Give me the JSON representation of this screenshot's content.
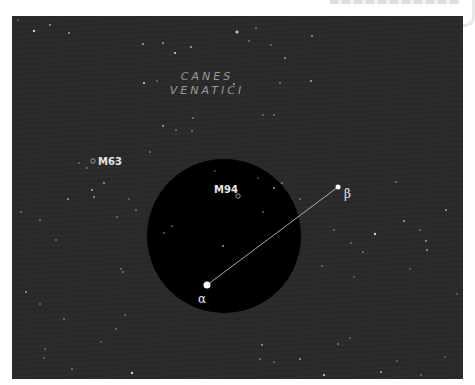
{
  "chart_data": {
    "type": "star-chart",
    "constellation": {
      "name_line1": "CANES",
      "name_line2": "VENATICI"
    },
    "field_of_view_circle": {
      "cx": 212,
      "cy": 220,
      "r": 77,
      "fill": "#000000"
    },
    "labeled_stars": [
      {
        "id": "alpha",
        "label": "α",
        "x": 195,
        "y": 269,
        "r": 3.5
      },
      {
        "id": "beta",
        "label": "β",
        "x": 326,
        "y": 171,
        "r": 2.5
      }
    ],
    "pointer_line": {
      "from": "alpha",
      "to": "beta",
      "color": "#cfcfcf"
    },
    "deep_sky_objects": [
      {
        "id": "M94",
        "label": "M94",
        "x": 226,
        "y": 180
      },
      {
        "id": "M63",
        "label": "M63",
        "x": 81,
        "y": 145
      }
    ],
    "background_stars": [
      [
        22,
        15,
        1.2
      ],
      [
        38,
        9,
        0.9
      ],
      [
        6,
        4,
        0.7
      ],
      [
        57,
        17,
        0.9
      ],
      [
        131,
        28,
        1.0
      ],
      [
        151,
        27,
        0.9
      ],
      [
        179,
        31,
        1.0
      ],
      [
        132,
        67,
        1.1
      ],
      [
        145,
        65,
        0.8
      ],
      [
        181,
        102,
        0.8
      ],
      [
        164,
        114,
        0.8
      ],
      [
        151,
        110,
        1.0
      ],
      [
        244,
        12,
        0.8
      ],
      [
        225,
        16,
        1.5
      ],
      [
        237,
        25,
        0.8
      ],
      [
        259,
        29,
        0.8
      ],
      [
        273,
        42,
        0.9
      ],
      [
        300,
        20,
        0.9
      ],
      [
        299,
        65,
        1.0
      ],
      [
        268,
        67,
        0.8
      ],
      [
        251,
        99,
        0.8
      ],
      [
        262,
        99,
        0.8
      ],
      [
        222,
        68,
        1.0
      ],
      [
        163,
        37,
        1.1
      ],
      [
        180,
        115,
        0.8
      ],
      [
        9,
        196,
        0.8
      ],
      [
        67,
        147,
        0.7
      ],
      [
        104,
        145,
        0.8
      ],
      [
        138,
        136,
        0.8
      ],
      [
        56,
        183,
        0.9
      ],
      [
        80,
        174,
        1.0
      ],
      [
        92,
        167,
        0.9
      ],
      [
        82,
        181,
        0.9
      ],
      [
        75,
        152,
        0.8
      ],
      [
        117,
        183,
        0.7
      ],
      [
        124,
        194,
        0.8
      ],
      [
        105,
        201,
        0.8
      ],
      [
        44,
        224,
        0.8
      ],
      [
        28,
        204,
        0.8
      ],
      [
        109,
        253,
        0.8
      ],
      [
        111,
        256,
        0.8
      ],
      [
        14,
        276,
        0.9
      ],
      [
        28,
        288,
        0.8
      ],
      [
        52,
        303,
        0.8
      ],
      [
        104,
        313,
        0.8
      ],
      [
        113,
        299,
        0.8
      ],
      [
        32,
        342,
        0.8
      ],
      [
        33,
        333,
        0.8
      ],
      [
        60,
        353,
        0.8
      ],
      [
        89,
        326,
        0.7
      ],
      [
        120,
        357,
        1.2
      ],
      [
        270,
        167,
        0.8
      ],
      [
        262,
        172,
        1.0
      ],
      [
        152,
        217,
        0.8
      ],
      [
        251,
        196,
        0.8
      ],
      [
        246,
        162,
        0.7
      ],
      [
        211,
        230,
        1.0
      ],
      [
        160,
        210,
        0.8
      ],
      [
        203,
        155,
        0.7
      ],
      [
        288,
        183,
        0.8
      ],
      [
        310,
        250,
        0.8
      ],
      [
        322,
        214,
        0.8
      ],
      [
        339,
        227,
        0.8
      ],
      [
        351,
        236,
        0.8
      ],
      [
        363,
        218,
        1.2
      ],
      [
        392,
        205,
        1.0
      ],
      [
        414,
        225,
        0.9
      ],
      [
        398,
        253,
        0.7
      ],
      [
        342,
        261,
        0.7
      ],
      [
        408,
        214,
        0.8
      ],
      [
        384,
        166,
        0.8
      ],
      [
        415,
        234,
        0.9
      ],
      [
        434,
        194,
        0.9
      ],
      [
        445,
        278,
        0.7
      ],
      [
        326,
        328,
        0.8
      ],
      [
        338,
        322,
        0.8
      ],
      [
        312,
        359,
        1.1
      ],
      [
        385,
        345,
        0.7
      ],
      [
        369,
        356,
        1.0
      ],
      [
        409,
        359,
        0.8
      ],
      [
        433,
        341,
        0.7
      ],
      [
        250,
        329,
        0.9
      ],
      [
        248,
        343,
        0.8
      ],
      [
        262,
        346,
        0.8
      ],
      [
        288,
        343,
        0.9
      ]
    ]
  }
}
